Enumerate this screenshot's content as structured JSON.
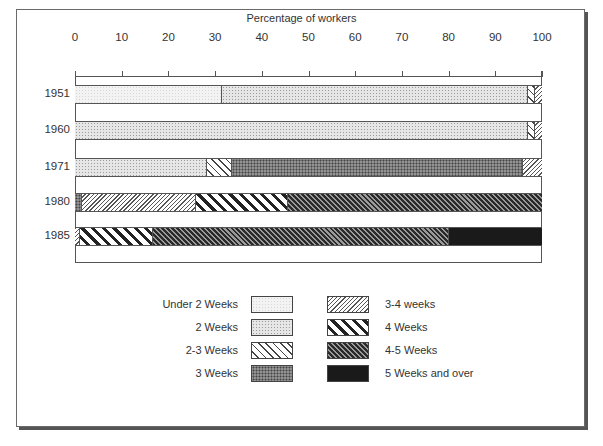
{
  "chart_data": {
    "type": "bar",
    "orientation": "horizontal",
    "stacked": true,
    "title": "",
    "xlabel": "Percentage of workers",
    "ylabel": "",
    "xlim": [
      0,
      100
    ],
    "x_ticks": [
      "0",
      "10",
      "20",
      "30",
      "40",
      "50",
      "60",
      "70",
      "80",
      "90",
      "100"
    ],
    "categories": [
      "1951",
      "1960",
      "1971",
      "1980",
      "1985"
    ],
    "series": [
      {
        "name": "Under 2 Weeks",
        "values": [
          31.5,
          0,
          0,
          0,
          0
        ]
      },
      {
        "name": "2 Weeks",
        "values": [
          65.5,
          97,
          28.3,
          0,
          0
        ]
      },
      {
        "name": "2-3 Weeks",
        "values": [
          1.5,
          1.5,
          5.3,
          0,
          0
        ]
      },
      {
        "name": "3 Weeks",
        "values": [
          0,
          0,
          62.4,
          1.5,
          0
        ]
      },
      {
        "name": "3-4 weeks",
        "values": [
          1.5,
          1.5,
          4,
          24.5,
          1
        ]
      },
      {
        "name": "4 Weeks",
        "values": [
          0,
          0,
          0,
          19.6,
          15.7
        ]
      },
      {
        "name": "4-5 Weeks",
        "values": [
          0,
          0,
          0,
          54.4,
          63.3
        ]
      },
      {
        "name": "5 Weeks and over",
        "values": [
          0,
          0,
          0,
          0,
          20
        ]
      }
    ],
    "grid": false,
    "legend_position": "bottom"
  },
  "axis": {
    "title": "Percentage of workers",
    "ticks": [
      "0",
      "10",
      "20",
      "30",
      "40",
      "50",
      "60",
      "70",
      "80",
      "90",
      "100"
    ]
  },
  "rows": [
    {
      "label": "1951",
      "segments": [
        {
          "pattern": "under2",
          "value": 31.5
        },
        {
          "pattern": "2w",
          "value": 65.5
        },
        {
          "pattern": "23w",
          "value": 1.5
        },
        {
          "pattern": "34w",
          "value": 1.5
        }
      ]
    },
    {
      "label": "1960",
      "segments": [
        {
          "pattern": "2w",
          "value": 97
        },
        {
          "pattern": "23w",
          "value": 1.5
        },
        {
          "pattern": "34w",
          "value": 1.5
        }
      ]
    },
    {
      "label": "1971",
      "segments": [
        {
          "pattern": "2w",
          "value": 28.3
        },
        {
          "pattern": "23w",
          "value": 5.3
        },
        {
          "pattern": "3w",
          "value": 62.4
        },
        {
          "pattern": "34w",
          "value": 4
        }
      ]
    },
    {
      "label": "1980",
      "segments": [
        {
          "pattern": "3w",
          "value": 1.5
        },
        {
          "pattern": "34w",
          "value": 24.5
        },
        {
          "pattern": "4w",
          "value": 19.6
        },
        {
          "pattern": "45w",
          "value": 54.4
        }
      ]
    },
    {
      "label": "1985",
      "segments": [
        {
          "pattern": "34w",
          "value": 1
        },
        {
          "pattern": "4w",
          "value": 15.7
        },
        {
          "pattern": "45w",
          "value": 63.3
        },
        {
          "pattern": "5w",
          "value": 20
        }
      ]
    }
  ],
  "legend": {
    "left": [
      {
        "label": "Under 2 Weeks",
        "pattern": "under2"
      },
      {
        "label": "2 Weeks",
        "pattern": "2w"
      },
      {
        "label": "2-3 Weeks",
        "pattern": "23w"
      },
      {
        "label": "3 Weeks",
        "pattern": "3w"
      }
    ],
    "right": [
      {
        "label": "3-4 weeks",
        "pattern": "34w"
      },
      {
        "label": "4 Weeks",
        "pattern": "4w"
      },
      {
        "label": "4-5 Weeks",
        "pattern": "45w"
      },
      {
        "label": "5 Weeks and over",
        "pattern": "5w"
      }
    ]
  }
}
